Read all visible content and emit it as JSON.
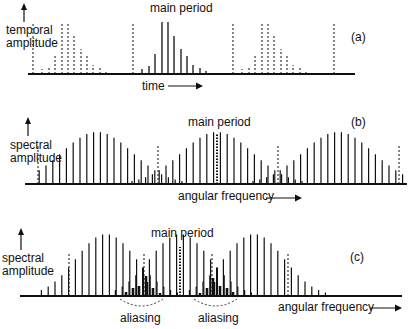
{
  "figure": {
    "panels": [
      {
        "id": "a",
        "tag": "(a)",
        "title": "main period",
        "ylabel_line1": "temporal",
        "ylabel_line2": "amplitude",
        "xlabel": "time",
        "axis_y": 74,
        "axis_x0": 28,
        "axis_x1": 355,
        "dashed_x": [
          33,
          133,
          233,
          334
        ],
        "period_width": 100,
        "main_center": 165,
        "solid_heights": [
          5,
          8,
          20,
          52,
          52,
          38,
          25,
          18,
          9,
          7,
          3
        ],
        "spacing": 6.5
      },
      {
        "id": "b",
        "tag": "(b)",
        "title": "main period",
        "ylabel_line1": "spectral",
        "ylabel_line2": "amplitude",
        "xlabel": "angular frequency",
        "axis_y": 184,
        "axis_x0": 25,
        "axis_x1": 407,
        "dashed_x": [
          38,
          158,
          278,
          399
        ],
        "dotted_x": 217
      },
      {
        "id": "c",
        "tag": "(c)",
        "title": "main period",
        "ylabel_line1": "spectral",
        "ylabel_line2": "amplitude",
        "xlabel": "angular frequency",
        "axis_y": 296,
        "axis_x0": 20,
        "axis_x1": 402,
        "dashed_x": [
          69,
          144,
          212,
          288
        ],
        "dotted_x": 180,
        "annotations": [
          "aliasing",
          "aliasing"
        ]
      }
    ]
  }
}
